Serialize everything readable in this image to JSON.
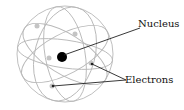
{
  "diagram": {
    "labels": {
      "nucleus": "Nucleus",
      "electrons": "Electrons"
    },
    "colors": {
      "orbit": "#b8b8b8",
      "nucleus": "#000000",
      "electron": "#c4c4c4",
      "leader": "#222222"
    }
  }
}
